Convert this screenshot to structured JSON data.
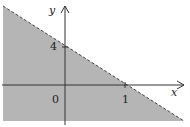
{
  "figure": {
    "labels": {
      "x_axis": "x",
      "y_axis": "y",
      "origin": "0",
      "x_tick": "1",
      "y_tick": "4"
    },
    "boundary": {
      "equation": "y = -4x + 4",
      "style": "dashed",
      "x_intercept": 1,
      "y_intercept": 4
    },
    "colors": {
      "shade": "#b5b5b5",
      "axis": "#333333",
      "boundary": "#444444",
      "background": "#ffffff"
    }
  }
}
